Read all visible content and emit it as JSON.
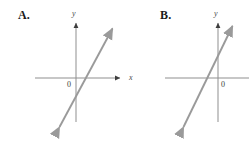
{
  "figure": {
    "width": 249,
    "height": 143,
    "background": "#ffffff",
    "axis_color": "#8f8f8f",
    "line_color": "#9a9a9a",
    "label_color": "#1a1a1a"
  },
  "panels": [
    {
      "id": "A",
      "label": "A.",
      "y_axis_label": "y",
      "x_axis_label": "x",
      "origin_label": "0",
      "graph": {
        "type": "line",
        "description": "straight line with positive slope passing just below the origin, arrowheads at both ends",
        "x_axis": {
          "y_pixel": 78,
          "x_from": 35,
          "x_to": 123,
          "arrow": "right"
        },
        "y_axis": {
          "x_pixel": 76,
          "y_from": 122,
          "y_to": 20,
          "arrow": "up"
        },
        "line_endpoints": [
          [
            58,
            130
          ],
          [
            114,
            25
          ]
        ],
        "slope_sign": "positive",
        "y_intercept_sign": "negative"
      }
    },
    {
      "id": "B",
      "label": "B.",
      "y_axis_label": "y",
      "x_axis_label": "",
      "origin_label": "0",
      "graph": {
        "type": "line",
        "description": "straight line with positive slope passing just left of the origin, arrowheads at both ends",
        "x_axis": {
          "y_pixel": 78,
          "x_from": 20,
          "x_to": 104,
          "arrow": "none"
        },
        "y_axis": {
          "x_pixel": 73,
          "y_from": 122,
          "y_to": 20,
          "arrow": "up"
        },
        "line_endpoints": [
          [
            37,
            130
          ],
          [
            89,
            22
          ]
        ],
        "slope_sign": "positive",
        "y_intercept_sign": "positive"
      }
    }
  ]
}
